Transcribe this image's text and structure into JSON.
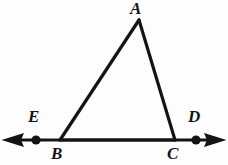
{
  "figure": {
    "kind": "geometry-diagram",
    "width": 228,
    "height": 165,
    "background_color": "#fdfdfd",
    "stroke_color": "#141414",
    "stroke_width": 3,
    "labels": {
      "apex": "A",
      "left_exterior": "E",
      "right_exterior": "D",
      "bottom_left": "B",
      "bottom_right": "C"
    },
    "points": {
      "A": {
        "x": 139,
        "y": 19
      },
      "B": {
        "x": 60,
        "y": 140
      },
      "C": {
        "x": 175,
        "y": 140
      },
      "E": {
        "x": 36,
        "y": 140
      },
      "D": {
        "x": 196,
        "y": 140
      }
    },
    "segments": [
      {
        "name": "side-AB",
        "from": "A",
        "to": "B"
      },
      {
        "name": "side-AC",
        "from": "A",
        "to": "C"
      },
      {
        "name": "base-BC",
        "from": "B",
        "to": "C"
      }
    ],
    "line": {
      "name": "line-ED",
      "y": 140,
      "x_start": 2,
      "x_end": 226,
      "arrow_left": true,
      "arrow_right": true
    },
    "dots": [
      {
        "name": "point-E",
        "x": 36,
        "y": 140,
        "radius": 4.5
      },
      {
        "name": "point-D",
        "x": 196,
        "y": 140,
        "radius": 4.5
      }
    ]
  }
}
